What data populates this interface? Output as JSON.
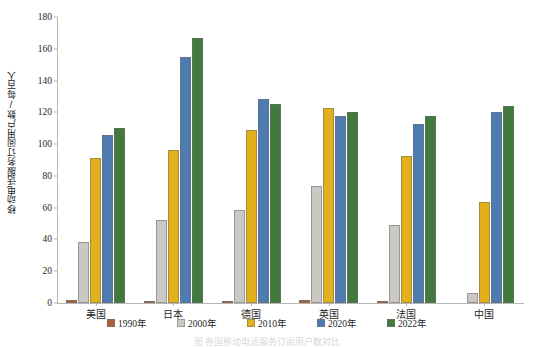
{
  "chart_data": {
    "type": "bar",
    "title": "",
    "subtitle": "",
    "xlabel": "",
    "ylabel": "移动电话服务订阅用户数/每百人",
    "ylim": [
      0,
      180
    ],
    "ytick_step": 20,
    "yticks": [
      0,
      20,
      40,
      60,
      80,
      100,
      120,
      140,
      160,
      180
    ],
    "grid": false,
    "legend_position": "bottom",
    "categories": [
      "美国",
      "日本",
      "德国",
      "英国",
      "法国",
      "中国"
    ],
    "series": [
      {
        "name": "1990年",
        "color": "#a9633b",
        "values": [
          2.1,
          0.7,
          0.4,
          1.9,
          0.5,
          0.0
        ]
      },
      {
        "name": "2000年",
        "color": "#c9c8c3",
        "values": [
          38.5,
          52.5,
          58.5,
          73.5,
          49.0,
          6.2
        ]
      },
      {
        "name": "2010年",
        "color": "#e2b01b",
        "values": [
          91.5,
          96.5,
          109.0,
          122.5,
          92.5,
          63.5
        ]
      },
      {
        "name": "2020年",
        "color": "#4e7bb0",
        "values": [
          105.5,
          155.0,
          128.5,
          117.5,
          112.5,
          120.5
        ]
      },
      {
        "name": "2022年",
        "color": "#417a3c",
        "values": [
          110.0,
          166.5,
          125.0,
          120.5,
          118.0,
          124.0
        ]
      }
    ]
  },
  "axis": {
    "y_title": "移动电话服务订阅用户数/每百人"
  },
  "legend": {
    "items": [
      {
        "label": "1990年"
      },
      {
        "label": "2000年"
      },
      {
        "label": "2010年"
      },
      {
        "label": "2020年"
      },
      {
        "label": "2022年"
      }
    ]
  },
  "caption": {
    "text": "图  各国移动电话服务订阅用户数对比"
  },
  "colors": {
    "series_1990": "#a9633b",
    "series_2000": "#c9c8c3",
    "series_2010": "#e2b01b",
    "series_2020": "#4e7bb0",
    "series_2022": "#417a3c",
    "axis": "#b7b7b7",
    "text": "#1f1f1f"
  }
}
